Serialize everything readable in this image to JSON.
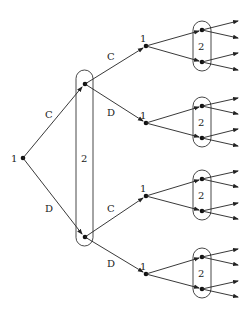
{
  "diagram": {
    "type": "extensive-form game tree",
    "root": {
      "player_label": "1"
    },
    "first_actions": [
      "C",
      "D"
    ],
    "player2_infoset_label": "2",
    "second_level": [
      {
        "parent_action": "C",
        "player_label": "1",
        "actions": [
          "C",
          "D"
        ]
      }
    ],
    "third_level": [
      {
        "path": "C-C",
        "player_label": "1",
        "infoset_label": "2"
      },
      {
        "path": "C-D",
        "player_label": "1",
        "infoset_label": "2"
      },
      {
        "path": "D-C",
        "player_label": "1",
        "infoset_label": "2"
      },
      {
        "path": "D-D",
        "player_label": "1",
        "infoset_label": "2"
      }
    ],
    "labels": {
      "root": "1",
      "edge_root_C": "C",
      "edge_root_D": "D",
      "big_infoset": "2",
      "upper_C": "C",
      "upper_D": "D",
      "lower_C": "C",
      "lower_D": "D",
      "p1": "1",
      "p2": "2"
    }
  }
}
